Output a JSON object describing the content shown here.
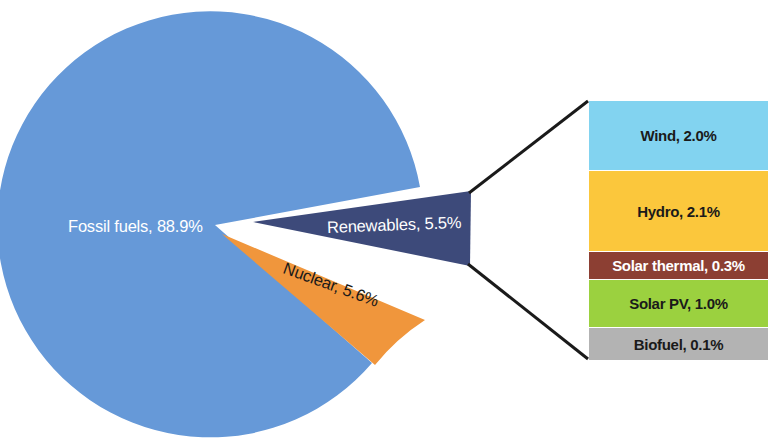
{
  "chart_data": {
    "type": "pie",
    "title": "",
    "subtitle": "",
    "xlabel": "",
    "ylabel": "",
    "legend_position": "right-exploded-panel",
    "grid": false,
    "units": "percent",
    "categories": [
      "Fossil fuels",
      "Nuclear",
      "Renewables"
    ],
    "values": [
      88.9,
      5.6,
      5.5
    ],
    "labels": [
      "Fossil fuels, 88.9%",
      "Nuclear, 5.6%",
      "Renewables, 5.5%"
    ],
    "colors": [
      "#6699d8",
      "#f0963c",
      "#3d4a7a"
    ],
    "exploded_slice": "Renewables",
    "breakout": {
      "parent": "Renewables",
      "parent_total": 5.5,
      "categories": [
        "Wind",
        "Hydro",
        "Solar thermal",
        "Solar PV",
        "Biofuel"
      ],
      "values": [
        2.0,
        2.1,
        0.3,
        1.0,
        0.1
      ],
      "labels": [
        "Wind, 2.0%",
        "Hydro, 2.1%",
        "Solar thermal, 0.3%",
        "Solar PV, 1.0%",
        "Biofuel, 0.1%"
      ],
      "colors": [
        "#82d3f0",
        "#fbc githubusercontent"
      ]
    }
  },
  "pie": {
    "slices": [
      {
        "name": "fossil-fuels",
        "label": "Fossil fuels, 88.9%",
        "value": 88.9,
        "color": "#6699d8",
        "text_color": "#ffffff"
      },
      {
        "name": "nuclear",
        "label": "Nuclear, 5.6%",
        "value": 5.6,
        "color": "#f0963c",
        "text_color": "#1a1a1a"
      },
      {
        "name": "renewables",
        "label": "Renewables, 5.5%",
        "value": 5.5,
        "color": "#3d4a7a",
        "text_color": "#ffffff"
      }
    ]
  },
  "legend": {
    "bands": [
      {
        "name": "wind",
        "label": "Wind, 2.0%",
        "value": 2.0,
        "color": "#82d3f0",
        "text_color": "#1a1a1a",
        "height": 70
      },
      {
        "name": "hydro",
        "label": "Hydro, 2.1%",
        "value": 2.1,
        "color": "#fbc73c",
        "text_color": "#1a1a1a",
        "height": 81
      },
      {
        "name": "solar-thermal",
        "label": "Solar thermal, 0.3%",
        "value": 0.3,
        "color": "#8c3f33",
        "text_color": "#ffffff",
        "height": 28
      },
      {
        "name": "solar-pv",
        "label": "Solar PV, 1.0%",
        "value": 1.0,
        "color": "#9bd13f",
        "text_color": "#1a1a1a",
        "height": 48
      },
      {
        "name": "biofuel",
        "label": "Biofuel, 0.1%",
        "value": 0.1,
        "color": "#b3b3b3",
        "text_color": "#1a1a1a",
        "height": 32
      }
    ]
  },
  "connectors": {
    "color": "#1a1a1a",
    "top": "wedge-top-to-legend-top",
    "bottom": "wedge-bottom-to-legend-bottom"
  }
}
